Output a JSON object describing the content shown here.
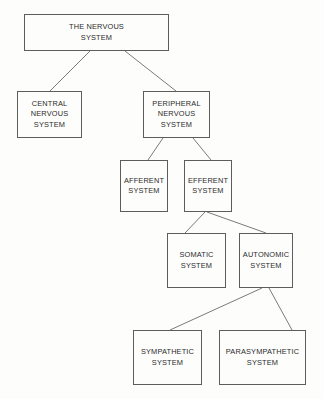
{
  "diagram": {
    "background_color": "#fdfdfc",
    "line_color": "#6b6b6b",
    "border_color": "#5d5d5d",
    "text_color": "#2b2b2b",
    "nodes": [
      {
        "id": "the-nervous-system",
        "label": "THE NERVOUS\nSYSTEM",
        "x": 24,
        "y": 14,
        "w": 145,
        "h": 37
      },
      {
        "id": "central-nervous",
        "label": "CENTRAL\nNERVOUS\nSYSTEM",
        "x": 17,
        "y": 91,
        "w": 65,
        "h": 47
      },
      {
        "id": "peripheral-nervous",
        "label": "PERIPHERAL\nNERVOUS\nSYSTEM",
        "x": 143,
        "y": 91,
        "w": 67,
        "h": 47
      },
      {
        "id": "afferent-system",
        "label": "AFFERENT\nSYSTEM",
        "x": 120,
        "y": 160,
        "w": 48,
        "h": 52
      },
      {
        "id": "efferent-system",
        "label": "EFFERENT\nSYSTEM",
        "x": 184,
        "y": 160,
        "w": 48,
        "h": 52
      },
      {
        "id": "somatic-system",
        "label": "SOMATIC\nSYSTEM",
        "x": 167,
        "y": 233,
        "w": 59,
        "h": 55
      },
      {
        "id": "autonomic-system",
        "label": "AUTONOMIC\nSYSTEM",
        "x": 239,
        "y": 233,
        "w": 54,
        "h": 55
      },
      {
        "id": "sympathetic-system",
        "label": "SYMPATHETIC\nSYSTEM",
        "x": 133,
        "y": 330,
        "w": 69,
        "h": 55
      },
      {
        "id": "parasympathetic-system",
        "label": "PARASYMPATHETIC\nSYSTEM",
        "x": 219,
        "y": 330,
        "w": 87,
        "h": 55
      }
    ],
    "edges": [
      {
        "id": "edge-root-to-central",
        "from": "the-nervous-system",
        "to": "central-nervous",
        "x1": 90,
        "y1": 51,
        "x2": 50,
        "y2": 91
      },
      {
        "id": "edge-root-to-peripheral",
        "from": "the-nervous-system",
        "to": "peripheral-nervous",
        "x1": 125,
        "y1": 51,
        "x2": 176,
        "y2": 91
      },
      {
        "id": "edge-peripheral-to-afferent",
        "from": "peripheral-nervous",
        "to": "afferent-system",
        "x1": 163,
        "y1": 138,
        "x2": 148,
        "y2": 160
      },
      {
        "id": "edge-peripheral-to-efferent",
        "from": "peripheral-nervous",
        "to": "efferent-system",
        "x1": 193,
        "y1": 138,
        "x2": 211,
        "y2": 160
      },
      {
        "id": "edge-efferent-to-somatic",
        "from": "efferent-system",
        "to": "somatic-system",
        "x1": 205,
        "y1": 212,
        "x2": 185,
        "y2": 233
      },
      {
        "id": "edge-efferent-to-autonomic",
        "from": "efferent-system",
        "to": "autonomic-system",
        "x1": 207,
        "y1": 212,
        "x2": 266,
        "y2": 233
      },
      {
        "id": "edge-autonomic-to-sympathetic",
        "from": "autonomic-system",
        "to": "sympathetic-system",
        "x1": 262,
        "y1": 288,
        "x2": 170,
        "y2": 330
      },
      {
        "id": "edge-autonomic-to-parasympathetic",
        "from": "autonomic-system",
        "to": "parasympathetic-system",
        "x1": 269,
        "y1": 288,
        "x2": 292,
        "y2": 330
      }
    ]
  }
}
